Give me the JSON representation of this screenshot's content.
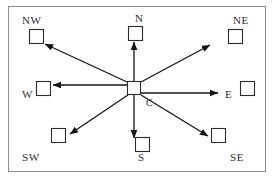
{
  "figure": {
    "border_color": "#8d8d8d",
    "line_color": "#141414",
    "node_stroke": "#2b2b2b",
    "background": "#ffffff"
  },
  "center": {
    "label": "C",
    "name": "center",
    "x": 134,
    "y": 88,
    "size": 13
  },
  "directions": [
    {
      "label": "NW",
      "key": "northwest",
      "square_x": 29,
      "square_y": 29,
      "size": 14,
      "label_x": 22,
      "label_y": 24,
      "arrow_from_x": 127,
      "arrow_from_y": 82,
      "arrow_to_x": 45,
      "arrow_to_y": 44
    },
    {
      "label": "N",
      "key": "north",
      "square_x": 128,
      "square_y": 26,
      "size": 14,
      "label_x": 135,
      "label_y": 22,
      "arrow_from_x": 134,
      "arrow_from_y": 82,
      "arrow_to_x": 134,
      "arrow_to_y": 42
    },
    {
      "label": "NE",
      "key": "northeast",
      "square_x": 228,
      "square_y": 29,
      "size": 14,
      "label_x": 233,
      "label_y": 24,
      "arrow_from_x": 141,
      "arrow_from_y": 82,
      "arrow_to_x": 210,
      "arrow_to_y": 45
    },
    {
      "label": "W",
      "key": "west",
      "square_x": 36,
      "square_y": 81,
      "size": 14,
      "label_x": 22,
      "label_y": 98,
      "arrow_from_x": 127,
      "arrow_from_y": 85,
      "arrow_to_x": 53,
      "arrow_to_y": 85
    },
    {
      "label": "E",
      "key": "east",
      "square_x": 240,
      "square_y": 81,
      "size": 14,
      "label_x": 225,
      "label_y": 98,
      "arrow_from_x": 141,
      "arrow_from_y": 93,
      "arrow_to_x": 218,
      "arrow_to_y": 93
    },
    {
      "label": "SW",
      "key": "southwest",
      "square_x": 51,
      "square_y": 128,
      "size": 14,
      "label_x": 22,
      "label_y": 161,
      "arrow_from_x": 128,
      "arrow_from_y": 95,
      "arrow_to_x": 70,
      "arrow_to_y": 134
    },
    {
      "label": "S",
      "key": "south",
      "square_x": 135,
      "square_y": 137,
      "size": 14,
      "label_x": 138,
      "label_y": 161,
      "arrow_from_x": 134,
      "arrow_from_y": 95,
      "arrow_to_x": 134,
      "arrow_to_y": 138
    },
    {
      "label": "SE",
      "key": "southeast",
      "square_x": 211,
      "square_y": 128,
      "size": 14,
      "label_x": 230,
      "label_y": 161,
      "arrow_from_x": 141,
      "arrow_from_y": 95,
      "arrow_to_x": 208,
      "arrow_to_y": 136
    }
  ],
  "frame": {
    "x": 8,
    "y": 6,
    "width": 258,
    "height": 166
  }
}
